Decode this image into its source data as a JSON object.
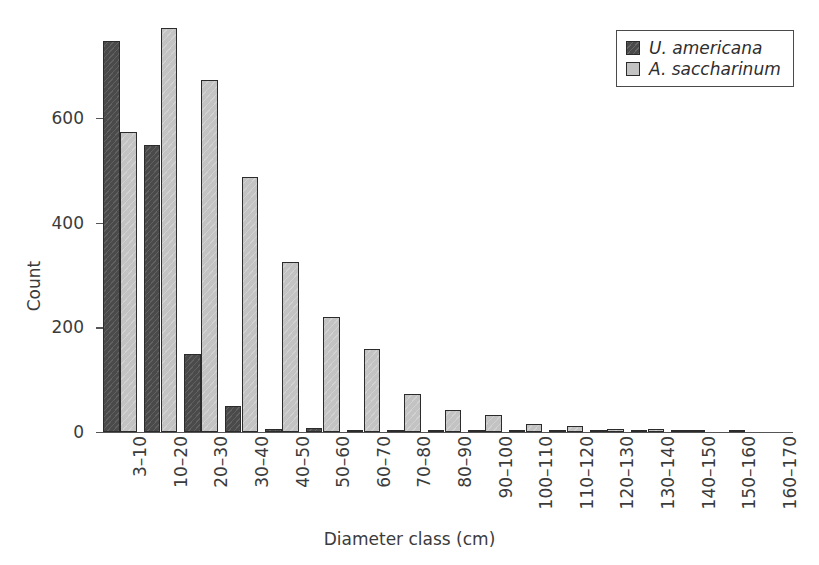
{
  "chart_data": {
    "type": "bar",
    "title": "",
    "xlabel": "Diameter class (cm)",
    "ylabel": "Count",
    "categories": [
      "3–10",
      "10–20",
      "20–30",
      "30–40",
      "40–50",
      "50–60",
      "60–70",
      "70–80",
      "80–90",
      "90–100",
      "100–110",
      "110–120",
      "120–130",
      "130–140",
      "140–150",
      "150–160",
      "160–170"
    ],
    "series": [
      {
        "name": "U. americana",
        "color": "#4a4a4a",
        "values": [
          748,
          548,
          150,
          50,
          6,
          7,
          4,
          2,
          2,
          2,
          2,
          2,
          3,
          4,
          3,
          0,
          0
        ]
      },
      {
        "name": "A. saccharinum",
        "color": "#c3c3c3",
        "values": [
          574,
          772,
          673,
          487,
          325,
          219,
          158,
          73,
          42,
          33,
          16,
          11,
          5,
          6,
          4,
          1,
          0
        ]
      }
    ],
    "ylim": [
      0,
      790
    ],
    "yticks": [
      0,
      200,
      400,
      600
    ],
    "ytick_labels": [
      "0",
      "200",
      "400",
      "600"
    ],
    "grid": false,
    "legend_position": "top-right"
  },
  "axes": {
    "y_title": "Count",
    "x_title": "Diameter class (cm)"
  }
}
